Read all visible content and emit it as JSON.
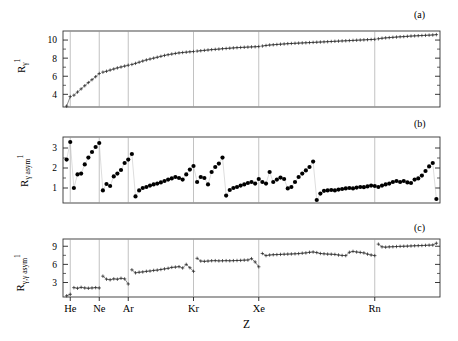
{
  "figure": {
    "xlabel": "Z",
    "xtick_labels": [
      "He",
      "Ne",
      "Ar",
      "Kr",
      "Xe",
      "Rn"
    ],
    "xtick_z": [
      2,
      10,
      18,
      36,
      54,
      86
    ],
    "xlim": [
      0,
      104
    ],
    "panels": [
      {
        "tag": "(a)",
        "ylabel_base": "R",
        "ylabel_sub": "γ",
        "ylabel_sup": "1",
        "yticks": [
          4,
          6,
          8,
          10
        ],
        "ylim": [
          2.6,
          11.0
        ],
        "style": "line-plus"
      },
      {
        "tag": "(b)",
        "ylabel_base": "R",
        "ylabel_sub": "γ asym",
        "ylabel_sup": "1",
        "yticks": [
          1,
          2,
          3
        ],
        "ylim": [
          0.25,
          3.55
        ],
        "style": "dots"
      },
      {
        "tag": "(c)",
        "ylabel_base": "R",
        "ylabel_sub": "γ,γ asym",
        "ylabel_sup": "1",
        "yticks": [
          3,
          6,
          9
        ],
        "ylim": [
          0.6,
          10.2
        ],
        "style": "line-plus"
      }
    ]
  },
  "chart_data": {
    "type": "line",
    "title": "",
    "xlabel": "Z",
    "xlim": [
      0,
      104
    ],
    "grid": "vertical gridlines at noble-gas Z (2,10,18,36,54,86)",
    "legend": "none",
    "annotations": [
      "(a)",
      "(b)",
      "(c)"
    ],
    "shared_x": [
      1,
      2,
      3,
      4,
      5,
      6,
      7,
      8,
      9,
      10,
      11,
      12,
      13,
      14,
      15,
      16,
      17,
      18,
      19,
      20,
      21,
      22,
      23,
      24,
      25,
      26,
      27,
      28,
      29,
      30,
      31,
      32,
      33,
      34,
      35,
      36,
      37,
      38,
      39,
      40,
      41,
      42,
      43,
      44,
      45,
      46,
      47,
      48,
      49,
      50,
      51,
      52,
      53,
      54,
      55,
      56,
      57,
      58,
      59,
      60,
      61,
      62,
      63,
      64,
      65,
      66,
      67,
      68,
      69,
      70,
      71,
      72,
      73,
      74,
      75,
      76,
      77,
      78,
      79,
      80,
      81,
      82,
      83,
      84,
      85,
      86,
      87,
      88,
      89,
      90,
      91,
      92,
      93,
      94,
      95,
      96,
      97,
      98,
      99,
      100,
      101,
      102,
      103
    ],
    "series": [
      {
        "name": "R_gamma^1",
        "panel": "(a)",
        "ylabel": "R_γ^1",
        "ylim": [
          2.6,
          11.0
        ],
        "yticks": [
          4,
          6,
          8,
          10
        ],
        "marker": "plus",
        "values": [
          2.7,
          3.75,
          3.9,
          4.25,
          4.6,
          4.95,
          5.3,
          5.62,
          5.95,
          6.3,
          6.45,
          6.55,
          6.68,
          6.8,
          6.92,
          7.02,
          7.12,
          7.22,
          7.3,
          7.42,
          7.55,
          7.68,
          7.8,
          7.9,
          8.0,
          8.1,
          8.2,
          8.3,
          8.38,
          8.45,
          8.52,
          8.58,
          8.62,
          8.66,
          8.7,
          8.73,
          8.78,
          8.82,
          8.86,
          8.9,
          8.94,
          8.97,
          9.0,
          9.04,
          9.07,
          9.1,
          9.13,
          9.16,
          9.18,
          9.2,
          9.22,
          9.24,
          9.26,
          9.28,
          9.34,
          9.4,
          9.45,
          9.48,
          9.51,
          9.54,
          9.57,
          9.6,
          9.62,
          9.64,
          9.66,
          9.68,
          9.7,
          9.72,
          9.74,
          9.76,
          9.78,
          9.8,
          9.82,
          9.84,
          9.86,
          9.88,
          9.9,
          9.92,
          9.94,
          9.96,
          9.98,
          10.0,
          10.02,
          10.04,
          10.06,
          10.08,
          10.14,
          10.2,
          10.24,
          10.27,
          10.3,
          10.33,
          10.36,
          10.38,
          10.41,
          10.44,
          10.46,
          10.48,
          10.5,
          10.52,
          10.54,
          10.56,
          10.6
        ]
      },
      {
        "name": "R_gamma_asym^1",
        "panel": "(b)",
        "ylabel": "R_γ asym^1",
        "ylim": [
          0.25,
          3.55
        ],
        "yticks": [
          1,
          2,
          3
        ],
        "marker": "filled-circle",
        "values": [
          2.42,
          3.3,
          1.0,
          1.68,
          1.72,
          2.18,
          2.52,
          2.8,
          3.05,
          3.25,
          0.88,
          1.2,
          1.1,
          1.58,
          1.72,
          1.9,
          2.25,
          2.42,
          2.7,
          0.58,
          0.88,
          1.0,
          1.05,
          1.12,
          1.18,
          1.22,
          1.28,
          1.35,
          1.42,
          1.48,
          1.55,
          1.5,
          1.42,
          1.68,
          1.92,
          2.1,
          1.3,
          1.55,
          1.5,
          1.18,
          1.8,
          2.05,
          2.22,
          2.52,
          0.62,
          0.9,
          1.0,
          1.05,
          1.12,
          1.18,
          1.25,
          1.3,
          1.22,
          1.45,
          1.3,
          1.22,
          1.8,
          1.3,
          1.42,
          1.52,
          1.45,
          0.98,
          1.05,
          1.3,
          1.55,
          1.72,
          1.88,
          2.05,
          2.32,
          0.4,
          0.72,
          0.86,
          0.88,
          0.9,
          0.88,
          0.92,
          0.95,
          0.98,
          1.0,
          0.98,
          1.02,
          1.05,
          1.04,
          1.08,
          1.12,
          1.1,
          1.05,
          1.12,
          1.18,
          1.22,
          1.3,
          1.35,
          1.3,
          1.35,
          1.28,
          1.25,
          1.42,
          1.48,
          1.62,
          1.85,
          2.08,
          2.25,
          0.45
        ],
        "note": "strong sawtooth resets at each noble gas (Z=2,10,18,36,54,86)"
      },
      {
        "name": "R_gammagamma_asym^1",
        "panel": "(c)",
        "ylabel": "R_γ,γ asym^1",
        "ylim": [
          0.6,
          10.2
        ],
        "yticks": [
          3,
          6,
          9
        ],
        "marker": "plus",
        "values": [
          0.8,
          1.05,
          2.15,
          2.05,
          2.2,
          2.1,
          2.05,
          2.1,
          2.15,
          2.1,
          4.05,
          3.55,
          3.45,
          3.6,
          3.55,
          3.7,
          3.6,
          2.75,
          5.1,
          4.6,
          4.7,
          4.75,
          4.85,
          4.9,
          5.0,
          5.05,
          5.15,
          5.25,
          5.35,
          5.5,
          5.55,
          5.62,
          5.4,
          6.0,
          5.45,
          4.85,
          7.0,
          6.55,
          6.5,
          6.55,
          6.6,
          6.62,
          6.58,
          6.6,
          6.62,
          6.6,
          6.62,
          6.64,
          6.66,
          6.7,
          6.72,
          6.95,
          6.4,
          5.6,
          7.8,
          7.45,
          7.55,
          7.6,
          7.62,
          7.65,
          7.68,
          7.7,
          7.72,
          7.75,
          7.78,
          7.85,
          7.9,
          8.0,
          8.05,
          7.95,
          7.8,
          7.75,
          7.7,
          7.68,
          7.65,
          7.55,
          7.48,
          7.45,
          8.0,
          8.15,
          8.05,
          7.98,
          7.9,
          7.7,
          7.55,
          7.45,
          9.35,
          8.9,
          8.85,
          8.9,
          8.92,
          8.95,
          8.98,
          9.0,
          9.02,
          9.05,
          9.08,
          9.1,
          9.12,
          9.15,
          9.18,
          9.2,
          9.5
        ]
      }
    ]
  }
}
